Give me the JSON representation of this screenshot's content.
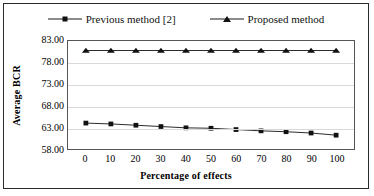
{
  "chart_data": {
    "type": "line",
    "title": "",
    "xlabel": "Percentage of effects",
    "ylabel": "Average BCR",
    "x": [
      0,
      10,
      20,
      30,
      40,
      50,
      60,
      70,
      80,
      90,
      100
    ],
    "xtick_labels": [
      "0",
      "10",
      "20",
      "30",
      "40",
      "50",
      "60",
      "70",
      "80",
      "90",
      "100"
    ],
    "ytick_labels": [
      "58.00",
      "63.00",
      "68.00",
      "73.00",
      "78.00",
      "83.00"
    ],
    "yticks": [
      58,
      63,
      68,
      73,
      78,
      83
    ],
    "ylim": [
      58,
      83
    ],
    "xlim": [
      0,
      100
    ],
    "grid": true,
    "legend_position": "top-center",
    "series": [
      {
        "name": "Previous method [2]",
        "marker": "square",
        "color": "#111111",
        "values": [
          64.0,
          63.8,
          63.5,
          63.2,
          62.9,
          62.8,
          62.5,
          62.2,
          62.0,
          61.7,
          61.2
        ]
      },
      {
        "name": "Proposed method",
        "marker": "triangle",
        "color": "#111111",
        "values": [
          80.8,
          80.8,
          80.8,
          80.8,
          80.8,
          80.8,
          80.8,
          80.8,
          80.8,
          80.8,
          80.8
        ]
      }
    ]
  }
}
